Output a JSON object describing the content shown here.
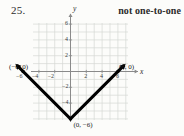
{
  "exercise": {
    "number": "25."
  },
  "answer": {
    "text": "not one-to-one"
  },
  "chart_data": {
    "type": "line",
    "title": "",
    "xlabel": "x",
    "ylabel": "y",
    "xlim": [
      -7,
      7
    ],
    "ylim": [
      -7,
      7
    ],
    "grid": true,
    "legend": null,
    "xticks": [
      -6,
      -4,
      -2,
      2,
      4,
      6
    ],
    "xtick_labels": [
      "−6",
      "−4",
      "−2",
      "2",
      "4",
      "6"
    ],
    "yticks": [
      6,
      4,
      2,
      -2,
      -4
    ],
    "ytick_labels": [
      "6",
      "4",
      "2",
      "−2",
      "−4"
    ],
    "series": [
      {
        "name": "y = |x| - 6",
        "x": [
          -6.8,
          0,
          6.8
        ],
        "y": [
          0.8,
          -6,
          0.8
        ],
        "color": "#000000",
        "width": 3,
        "arrows": "both"
      }
    ],
    "annotations": [
      {
        "label": "(−6, 0)",
        "x": -6,
        "y": 0
      },
      {
        "label": "(6, 0)",
        "x": 6,
        "y": 0
      },
      {
        "label": "(0, −6)",
        "x": 0,
        "y": -6
      }
    ],
    "points": [
      {
        "x": -6,
        "y": 0
      },
      {
        "x": 6,
        "y": 0
      },
      {
        "x": 0,
        "y": -6
      }
    ],
    "colors": {
      "grid": "#d6d9d4",
      "axis": "#8a8a8a",
      "curve": "#000000",
      "background": "#fcfcfa"
    }
  }
}
